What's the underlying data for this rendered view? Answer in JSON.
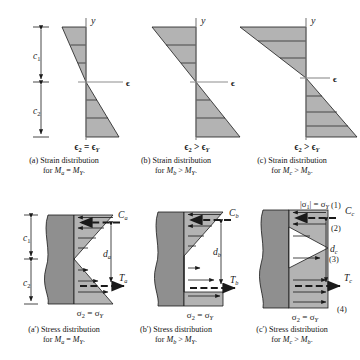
{
  "figure": {
    "colors": {
      "wedge_fill": "#b3b3b3",
      "beam_fill": "#8f8f8f",
      "line": "#1a1a1a",
      "background": "#ffffff"
    }
  },
  "strain_panels": [
    {
      "id": "a",
      "axis_label": "y",
      "strain_label": "ϵ",
      "bottom_label": "ϵ₂ = ϵY",
      "dim_labels": [
        "c₁",
        "c₂"
      ],
      "caption_line1": "(a) Strain distribution",
      "caption_line2": "for Mₐ = MY."
    },
    {
      "id": "b",
      "axis_label": "y",
      "strain_label": "ϵ",
      "bottom_label": "ϵ₂ > ϵY",
      "dim_labels": [],
      "caption_line1": "(b) Strain distribution",
      "caption_line2": "for Mʙ > MY."
    },
    {
      "id": "c",
      "axis_label": "y",
      "strain_label": "ϵ",
      "bottom_label": "ϵ₂ > ϵY",
      "dim_labels": [],
      "caption_line1": "(c) Strain distribution",
      "caption_line2": "for M꜀ > Mʙ."
    }
  ],
  "stress_panels": [
    {
      "id": "a-prime",
      "compression_force": "Cₐ",
      "tension_force": "Tₐ",
      "moment_arm": "dₐ",
      "bottom_label": "σ₂ = σY",
      "top_label": "",
      "dim_labels": [
        "c₁",
        "c₂"
      ],
      "callouts": [],
      "caption_line1": "(a′) Stress distribution",
      "caption_line2": "for Mₐ = MY."
    },
    {
      "id": "b-prime",
      "compression_force": "Cʙ",
      "tension_force": "Tʙ",
      "moment_arm": "dʙ",
      "bottom_label": "σ₂ = σY",
      "top_label": "",
      "dim_labels": [],
      "callouts": [],
      "caption_line1": "(b′) Stress distribution",
      "caption_line2": "for Mʙ > MY."
    },
    {
      "id": "c-prime",
      "compression_force": "C꜀",
      "tension_force": "T꜀",
      "moment_arm": "d꜀",
      "bottom_label": "σ₂ = σY",
      "top_label": "|σ₁| = σY",
      "dim_labels": [],
      "callouts": [
        "(1)",
        "(2)",
        "(3)",
        "(4)"
      ],
      "caption_line1": "(c′) Stress distribution",
      "caption_line2": "for M꜀ > Mʙ."
    }
  ]
}
